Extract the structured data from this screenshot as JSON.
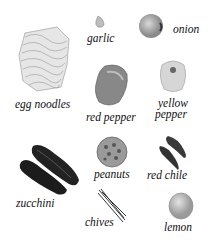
{
  "items": [
    {
      "id": "egg-noodles",
      "label": "egg noodles"
    },
    {
      "id": "garlic",
      "label": "garlic"
    },
    {
      "id": "onion",
      "label": "onion"
    },
    {
      "id": "red-pepper",
      "label": "red pepper"
    },
    {
      "id": "yellow-pepper",
      "label_line1": "yellow",
      "label_line2": "pepper"
    },
    {
      "id": "zucchini",
      "label": "zucchini"
    },
    {
      "id": "peanuts",
      "label": "peanuts"
    },
    {
      "id": "red-chile",
      "label": "red chile"
    },
    {
      "id": "chives",
      "label": "chives"
    },
    {
      "id": "lemon",
      "label": "lemon"
    }
  ]
}
